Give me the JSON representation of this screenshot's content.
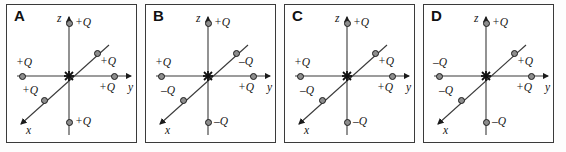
{
  "figure": {
    "panel_letters": [
      "A",
      "B",
      "C",
      "D"
    ],
    "axis_labels": {
      "x": "x",
      "y": "y",
      "z": "z"
    },
    "charge_positions": [
      "z-positive-top",
      "x-axis-diagonal-upper-right",
      "y-axis-negative-left",
      "x-axis-diagonal-lower-left",
      "y-axis-positive-right",
      "z-negative-bottom"
    ],
    "panels": [
      {
        "letter": "A",
        "charges": {
          "top": "+Q",
          "upper_right_diagonal": "+Q",
          "left": "+Q",
          "lower_left_diagonal": "+Q",
          "right": "+Q",
          "bottom": "+Q"
        }
      },
      {
        "letter": "B",
        "charges": {
          "top": "+Q",
          "upper_right_diagonal": "–Q",
          "left": "+Q",
          "lower_left_diagonal": "–Q",
          "right": "+Q",
          "bottom": "–Q"
        }
      },
      {
        "letter": "C",
        "charges": {
          "top": "+Q",
          "upper_right_diagonal": "+Q",
          "left": "+Q",
          "lower_left_diagonal": "–Q",
          "right": "+Q",
          "bottom": "–Q"
        }
      },
      {
        "letter": "D",
        "charges": {
          "top": "+Q",
          "upper_right_diagonal": "+Q",
          "left": "–Q",
          "lower_left_diagonal": "–Q",
          "right": "+Q",
          "bottom": "–Q"
        }
      }
    ]
  }
}
